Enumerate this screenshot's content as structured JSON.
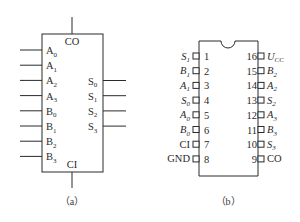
{
  "diagram_a": {
    "caption": "（a）",
    "top_label": "CO",
    "bottom_label": "CI",
    "inputs": [
      {
        "base": "A",
        "sub": "0"
      },
      {
        "base": "A",
        "sub": "1"
      },
      {
        "base": "A",
        "sub": "2"
      },
      {
        "base": "A",
        "sub": "3"
      },
      {
        "base": "B",
        "sub": "0"
      },
      {
        "base": "B",
        "sub": "1"
      },
      {
        "base": "B",
        "sub": "2"
      },
      {
        "base": "B",
        "sub": "3"
      }
    ],
    "outputs": [
      {
        "base": "S",
        "sub": "0"
      },
      {
        "base": "S",
        "sub": "1"
      },
      {
        "base": "S",
        "sub": "2"
      },
      {
        "base": "S",
        "sub": "3"
      }
    ]
  },
  "diagram_b": {
    "caption": "（b）",
    "left_pins": [
      {
        "num": "1",
        "base": "S",
        "sub": "1",
        "italic": true
      },
      {
        "num": "2",
        "base": "B",
        "sub": "1",
        "italic": true
      },
      {
        "num": "3",
        "base": "A",
        "sub": "1",
        "italic": true
      },
      {
        "num": "4",
        "base": "S",
        "sub": "0",
        "italic": true
      },
      {
        "num": "5",
        "base": "A",
        "sub": "0",
        "italic": true
      },
      {
        "num": "6",
        "base": "B",
        "sub": "0",
        "italic": true
      },
      {
        "num": "7",
        "base": "CI",
        "sub": "",
        "italic": false
      },
      {
        "num": "8",
        "base": "GND",
        "sub": "",
        "italic": false
      }
    ],
    "right_pins": [
      {
        "num": "16",
        "base": "U",
        "sub": "CC",
        "italic": true
      },
      {
        "num": "15",
        "base": "B",
        "sub": "2",
        "italic": true
      },
      {
        "num": "14",
        "base": "A",
        "sub": "2",
        "italic": true
      },
      {
        "num": "13",
        "base": "S",
        "sub": "2",
        "italic": true
      },
      {
        "num": "12",
        "base": "A",
        "sub": "3",
        "italic": true
      },
      {
        "num": "11",
        "base": "B",
        "sub": "3",
        "italic": true
      },
      {
        "num": "10",
        "base": "S",
        "sub": "3",
        "italic": true
      },
      {
        "num": "9",
        "base": "CO",
        "sub": "",
        "italic": false
      }
    ]
  }
}
